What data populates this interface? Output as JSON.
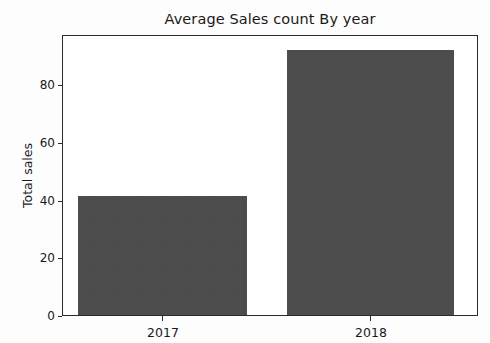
{
  "chart_data": {
    "type": "bar",
    "title": "Average Sales count By year",
    "xlabel": "",
    "ylabel": "Total sales",
    "categories": [
      "2017",
      "2018"
    ],
    "values": [
      41.6,
      92.4
    ],
    "series": [
      {
        "name": "Total sales",
        "values": [
          41.6,
          92.4
        ]
      }
    ],
    "ylim": [
      0,
      97.3
    ],
    "yticks": [
      0,
      20,
      40,
      60,
      80
    ],
    "ytick_labels": [
      "0",
      "20",
      "40",
      "60",
      "80"
    ],
    "xtick_labels": [
      "2017",
      "2018"
    ],
    "grid": false,
    "legend": false,
    "legend_position": "none",
    "bar_color": "#4a4a4a",
    "background_color": "#fdfdfd",
    "axes_color": "#2b2b2b",
    "text_color": "#1a1a1a"
  }
}
